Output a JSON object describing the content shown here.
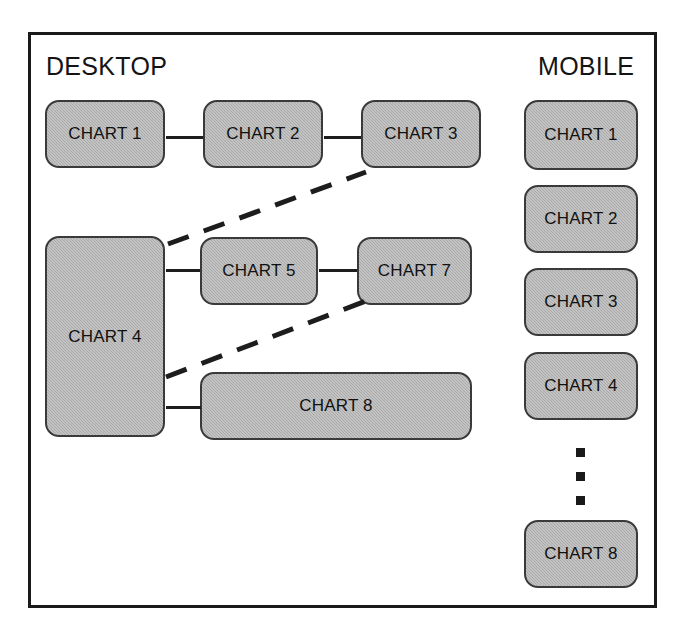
{
  "diagram": {
    "columns": {
      "desktop_title": "DESKTOP",
      "mobile_title": "MOBILE"
    },
    "desktop_boxes": [
      {
        "id": "d1",
        "label": "CHART 1"
      },
      {
        "id": "d2",
        "label": "CHART 2"
      },
      {
        "id": "d3",
        "label": "CHART 3"
      },
      {
        "id": "d4",
        "label": "CHART 4"
      },
      {
        "id": "d5",
        "label": "CHART 5"
      },
      {
        "id": "d7",
        "label": "CHART 7"
      },
      {
        "id": "d8",
        "label": "CHART 8"
      }
    ],
    "mobile_boxes": [
      {
        "id": "m1",
        "label": "CHART 1"
      },
      {
        "id": "m2",
        "label": "CHART 2"
      },
      {
        "id": "m3",
        "label": "CHART 3"
      },
      {
        "id": "m4",
        "label": "CHART 4"
      },
      {
        "id": "m8",
        "label": "CHART 8"
      }
    ],
    "ellipsis_dot_count": 3,
    "colors": {
      "box_fill": "#a9a9a9",
      "box_stroke": "#3a3a3a",
      "frame_stroke": "#1a1a1a",
      "connector": "#1d1d1d",
      "text": "#111111",
      "background": "#ffffff"
    }
  }
}
